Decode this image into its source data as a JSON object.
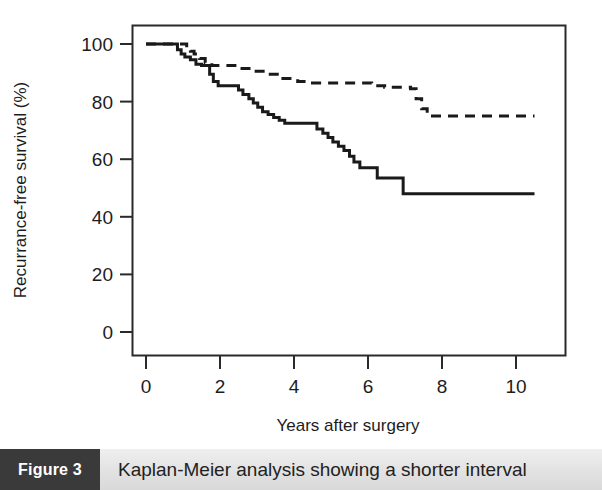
{
  "caption": {
    "figure_number": "Figure 3",
    "text": "Kaplan-Meier analysis showing a shorter interval"
  },
  "chart_data": {
    "type": "line",
    "title": "",
    "subtitle": "",
    "xlabel": "Years after surgery",
    "ylabel": "Recurrance-free survival (%)",
    "xlim": [
      0,
      11.3
    ],
    "ylim": [
      -8,
      108
    ],
    "xticks": [
      0,
      2,
      4,
      6,
      8,
      10
    ],
    "xtick_labels": [
      "0",
      "2",
      "4",
      "6",
      "8",
      "10"
    ],
    "yticks": [
      0,
      20,
      40,
      60,
      80,
      100
    ],
    "ytick_labels": [
      "0",
      "20",
      "40",
      "60",
      "80",
      "100"
    ],
    "grid": false,
    "legend": false,
    "legend_position": "none",
    "box_frame": true,
    "series": [
      {
        "name": "solid-curve",
        "style": "solid",
        "color": "#1a1a1a",
        "line_width": 3,
        "step": true,
        "final_value": 48,
        "points": [
          [
            0.0,
            100
          ],
          [
            0.75,
            100
          ],
          [
            0.85,
            98
          ],
          [
            0.95,
            96.5
          ],
          [
            1.05,
            95.5
          ],
          [
            1.2,
            94.5
          ],
          [
            1.35,
            93
          ],
          [
            1.5,
            92.5
          ],
          [
            1.62,
            92.5
          ],
          [
            1.72,
            89.5
          ],
          [
            1.82,
            87
          ],
          [
            1.95,
            85.5
          ],
          [
            2.35,
            85.5
          ],
          [
            2.5,
            84
          ],
          [
            2.62,
            82.5
          ],
          [
            2.78,
            81
          ],
          [
            2.9,
            79.5
          ],
          [
            3.02,
            78
          ],
          [
            3.15,
            76.5
          ],
          [
            3.3,
            75.5
          ],
          [
            3.45,
            74.5
          ],
          [
            3.6,
            73.5
          ],
          [
            3.75,
            72.5
          ],
          [
            4.35,
            72.5
          ],
          [
            4.5,
            72.5
          ],
          [
            4.62,
            70.5
          ],
          [
            4.78,
            69
          ],
          [
            4.92,
            67.5
          ],
          [
            5.05,
            66
          ],
          [
            5.2,
            64.5
          ],
          [
            5.35,
            63
          ],
          [
            5.5,
            61
          ],
          [
            5.62,
            59
          ],
          [
            5.78,
            57
          ],
          [
            6.15,
            57
          ],
          [
            6.25,
            53.5
          ],
          [
            6.85,
            53.5
          ],
          [
            6.95,
            48
          ],
          [
            10.5,
            48
          ]
        ]
      },
      {
        "name": "dashed-curve",
        "style": "dashed",
        "color": "#1a1a1a",
        "line_width": 3,
        "step": true,
        "final_value": 75,
        "points": [
          [
            0.0,
            100
          ],
          [
            0.95,
            100
          ],
          [
            1.1,
            98.5
          ],
          [
            1.2,
            97.5
          ],
          [
            1.3,
            96.5
          ],
          [
            1.45,
            95
          ],
          [
            1.6,
            93.5
          ],
          [
            1.78,
            92.5
          ],
          [
            2.1,
            92.5
          ],
          [
            2.5,
            91.5
          ],
          [
            2.9,
            90.5
          ],
          [
            3.3,
            89.5
          ],
          [
            3.7,
            88
          ],
          [
            4.1,
            87
          ],
          [
            4.5,
            86.5
          ],
          [
            5.2,
            86.5
          ],
          [
            5.9,
            86.5
          ],
          [
            6.1,
            85.5
          ],
          [
            6.45,
            85
          ],
          [
            7.0,
            85
          ],
          [
            7.15,
            84.5
          ],
          [
            7.3,
            81
          ],
          [
            7.45,
            77.5
          ],
          [
            7.6,
            75
          ],
          [
            10.5,
            75
          ]
        ]
      }
    ]
  },
  "colors": {
    "curve": "#1a1a1a",
    "axis": "#2a2a2a",
    "caption_block_bg": "#3a3a3a",
    "caption_bar_bg": "#e4e4e4",
    "background": "#ffffff"
  }
}
